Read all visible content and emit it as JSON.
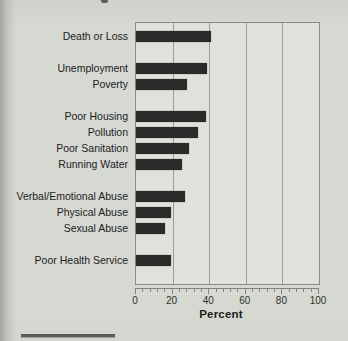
{
  "colors": {
    "page_bg": "#d6d8d2",
    "plot_bg": "#e0e1db",
    "bar": "#2a2a28",
    "grid": "#9a9c96",
    "border": "#8a8c86",
    "text": "#222222"
  },
  "chart_data": {
    "type": "bar",
    "orientation": "horizontal",
    "title": "",
    "xlabel": "Percent",
    "ylabel": "",
    "xlim": [
      0,
      100
    ],
    "xticks": [
      0,
      20,
      40,
      60,
      80,
      100
    ],
    "minor_tick_step": 4,
    "grid": true,
    "legend": false,
    "categories": [
      "Death or Loss",
      "Unemployment",
      "Poverty",
      "Poor Housing",
      "Pollution",
      "Poor Sanitation",
      "Running Water",
      "Verbal/Emotional Abuse",
      "Physical Abuse",
      "Sexual Abuse",
      "Poor Health Service"
    ],
    "values": [
      41,
      39,
      28,
      38,
      34,
      29,
      25,
      27,
      19,
      16,
      19
    ],
    "groups": [
      {
        "bars": [
          {
            "label": "Death or Loss",
            "value": 41
          }
        ]
      },
      {
        "bars": [
          {
            "label": "Unemployment",
            "value": 39
          },
          {
            "label": "Poverty",
            "value": 28
          }
        ]
      },
      {
        "bars": [
          {
            "label": "Poor Housing",
            "value": 38
          },
          {
            "label": "Pollution",
            "value": 34
          },
          {
            "label": "Poor Sanitation",
            "value": 29
          },
          {
            "label": "Running Water",
            "value": 25
          }
        ]
      },
      {
        "bars": [
          {
            "label": "Verbal/Emotional Abuse",
            "value": 27
          },
          {
            "label": "Physical Abuse",
            "value": 19
          },
          {
            "label": "Sexual Abuse",
            "value": 16
          }
        ]
      },
      {
        "bars": [
          {
            "label": "Poor Health Service",
            "value": 19
          }
        ]
      }
    ]
  }
}
